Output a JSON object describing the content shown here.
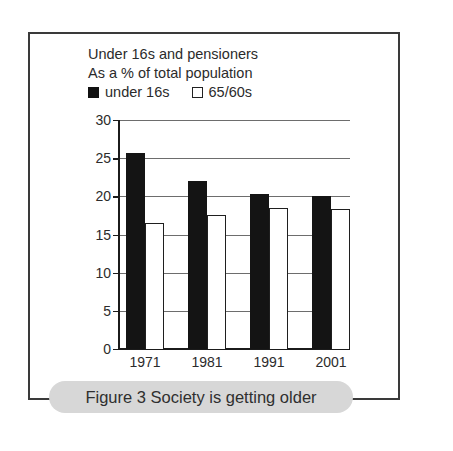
{
  "figure": {
    "caption": "Figure 3 Society is getting older",
    "frame_color": "#3a3a3a",
    "caption_pill_color": "#d7d7d7"
  },
  "chart_data": {
    "type": "bar",
    "title": "Under 16s and pensioners",
    "subtitle": "As a % of total population",
    "xlabel": "",
    "ylabel": "",
    "categories": [
      "1971",
      "1981",
      "1991",
      "2001"
    ],
    "series": [
      {
        "name": "under 16s",
        "color": "#141414",
        "swatch": "filled-square",
        "values": [
          25.7,
          22.0,
          20.3,
          20.0
        ]
      },
      {
        "name": "65/60s",
        "color": "#ffffff",
        "swatch": "hollow-square",
        "values": [
          16.5,
          17.5,
          18.5,
          18.3
        ]
      }
    ],
    "ylim": [
      0,
      30
    ],
    "yticks": [
      0,
      5,
      10,
      15,
      20,
      25,
      30
    ],
    "ytick_labels": [
      "0",
      "5",
      "10",
      "15",
      "20",
      "25",
      "30"
    ],
    "grid": true,
    "grid_color": "#6d6d6d",
    "legend_position": "top-left"
  }
}
